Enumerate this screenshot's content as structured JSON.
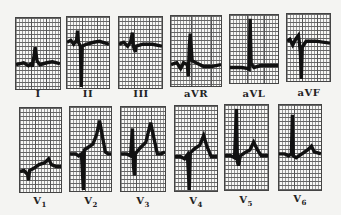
{
  "figure": {
    "rows": [
      {
        "leads": [
          {
            "id": "I",
            "label": "I",
            "sub": ""
          },
          {
            "id": "II",
            "label": "II",
            "sub": ""
          },
          {
            "id": "III",
            "label": "III",
            "sub": ""
          },
          {
            "id": "aVR",
            "label": "aVR",
            "sub": ""
          },
          {
            "id": "aVL",
            "label": "aVL",
            "sub": ""
          },
          {
            "id": "aVF",
            "label": "aVF",
            "sub": ""
          }
        ]
      },
      {
        "leads": [
          {
            "id": "V1",
            "label": "V",
            "sub": "1"
          },
          {
            "id": "V2",
            "label": "V",
            "sub": "2"
          },
          {
            "id": "V3",
            "label": "V",
            "sub": "3"
          },
          {
            "id": "V4",
            "label": "V",
            "sub": "4"
          },
          {
            "id": "V5",
            "label": "V",
            "sub": "5"
          },
          {
            "id": "V6",
            "label": "V",
            "sub": "6"
          }
        ]
      }
    ]
  },
  "colors": {
    "trace": "#111111",
    "grid": "#666666",
    "background": "#f4f4f2"
  }
}
